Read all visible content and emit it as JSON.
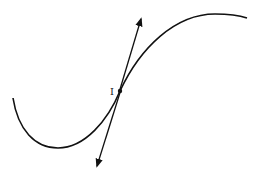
{
  "diagram": {
    "title": "",
    "point_label": "I",
    "colors": {
      "stroke": "#111111",
      "background": "#ffffff"
    },
    "curve": {
      "start": [
        13,
        98
      ],
      "local_min": [
        58,
        148
      ],
      "inflection": [
        120,
        91
      ],
      "local_max": [
        215,
        14
      ],
      "end": [
        247,
        18
      ]
    },
    "tangent": {
      "top_arrow": [
        141,
        19
      ],
      "bottom_arrow": [
        97,
        166
      ]
    }
  }
}
